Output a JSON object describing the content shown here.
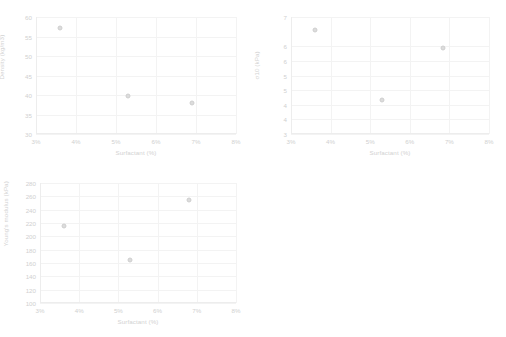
{
  "charts": [
    {
      "id": "density",
      "chart_data": {
        "type": "scatter",
        "title": "",
        "xlabel": "Surfactant (%)",
        "ylabel": "Density (kg/m3)",
        "xlim": [
          3,
          8
        ],
        "ylim": [
          30,
          60
        ],
        "xticks": [
          "3%",
          "4%",
          "5%",
          "6%",
          "7%",
          "8%"
        ],
        "xtick_values": [
          3,
          4,
          5,
          6,
          7,
          8
        ],
        "yticks": [
          "30",
          "35",
          "40",
          "45",
          "50",
          "55",
          "60"
        ],
        "ytick_values": [
          30,
          35,
          40,
          45,
          50,
          55,
          60
        ],
        "grid": true,
        "legend": "none",
        "x": [
          3.6,
          5.3,
          6.9
        ],
        "y": [
          57.2,
          39.8,
          38.0
        ]
      }
    },
    {
      "id": "sigma10",
      "chart_data": {
        "type": "scatter",
        "title": "",
        "xlabel": "Surfactant (%)",
        "ylabel": "σ10 (kPa)",
        "xlim": [
          3,
          8
        ],
        "ylim": [
          3,
          7
        ],
        "xticks": [
          "3%",
          "4%",
          "5%",
          "6%",
          "7%",
          "8%"
        ],
        "xtick_values": [
          3,
          4,
          5,
          6,
          7,
          8
        ],
        "yticks": [
          "3",
          "4",
          "4",
          "5",
          "5",
          "6",
          "6",
          "7"
        ],
        "ytick_values": [
          3,
          3.5,
          4,
          4.5,
          5,
          5.5,
          6,
          7
        ],
        "grid": true,
        "legend": "none",
        "x": [
          3.6,
          5.3,
          6.85
        ],
        "y": [
          6.55,
          4.15,
          5.95
        ]
      }
    },
    {
      "id": "youngs-modulus",
      "chart_data": {
        "type": "scatter",
        "title": "",
        "xlabel": "Surfactant (%)",
        "ylabel": "Young's modulus (kPa)",
        "xlim": [
          3,
          8
        ],
        "ylim": [
          100,
          280
        ],
        "xticks": [
          "3%",
          "4%",
          "5%",
          "6%",
          "7%",
          "8%"
        ],
        "xtick_values": [
          3,
          4,
          5,
          6,
          7,
          8
        ],
        "yticks": [
          "100",
          "120",
          "140",
          "160",
          "180",
          "200",
          "220",
          "240",
          "260",
          "280"
        ],
        "ytick_values": [
          100,
          120,
          140,
          160,
          180,
          200,
          220,
          240,
          260,
          280
        ],
        "grid": true,
        "legend": "none",
        "x": [
          3.6,
          5.3,
          6.8
        ],
        "y": [
          215,
          165,
          255
        ]
      }
    }
  ]
}
